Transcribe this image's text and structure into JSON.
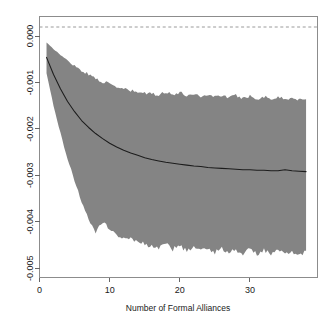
{
  "chart_data": {
    "type": "line",
    "title": "",
    "subtitle": "",
    "xlabel": "Number of Formal Alliances",
    "ylabel": "",
    "xlim": [
      0,
      39.7
    ],
    "ylim": [
      -0.0052,
      0.00042
    ],
    "grid": false,
    "legend": null,
    "colors": {
      "band_fill": "#848484",
      "fit_line": "#1c1c1c",
      "zero_line": "#9a9a9a",
      "frame": "#8c8c8c"
    },
    "annotations": [
      {
        "name": "zero-reference-line",
        "type": "hline",
        "y": 0.0,
        "style": "dashed"
      }
    ],
    "xticks": [
      0,
      10,
      20,
      30
    ],
    "xticklabels": [
      "0",
      "10",
      "20",
      "30"
    ],
    "yticks": [
      0.0,
      -0.001,
      -0.002,
      -0.003,
      -0.004,
      -0.005
    ],
    "yticklabels": [
      "0.000",
      "-0.001",
      "-0.002",
      "-0.003",
      "-0.004",
      "-0.005"
    ],
    "x": [
      1,
      2,
      3,
      4,
      5,
      6,
      7,
      8,
      9,
      10,
      11,
      12,
      13,
      14,
      15,
      16,
      17,
      18,
      19,
      20,
      21,
      22,
      23,
      24,
      25,
      26,
      27,
      28,
      29,
      30,
      31,
      32,
      33,
      34,
      35,
      36,
      37,
      38
    ],
    "series": [
      {
        "name": "estimated effect",
        "type": "line",
        "values": [
          -0.00046,
          -0.00083,
          -0.00114,
          -0.00141,
          -0.00163,
          -0.00182,
          -0.00197,
          -0.0021,
          -0.00221,
          -0.00231,
          -0.00239,
          -0.00246,
          -0.00252,
          -0.00257,
          -0.00262,
          -0.00266,
          -0.00269,
          -0.00272,
          -0.00274,
          -0.00276,
          -0.00278,
          -0.0028,
          -0.00281,
          -0.00283,
          -0.00284,
          -0.00285,
          -0.00286,
          -0.00287,
          -0.00288,
          -0.00288,
          -0.00289,
          -0.00289,
          -0.0029,
          -0.0029,
          -0.00288,
          -0.0029,
          -0.00291,
          -0.00292
        ]
      },
      {
        "name": "confidence band upper",
        "type": "band-edge",
        "values": [
          -0.00014,
          -0.00028,
          -0.00041,
          -0.00053,
          -0.00064,
          -0.00074,
          -0.00083,
          -0.00091,
          -0.00098,
          -0.00104,
          -0.0011,
          -0.00114,
          -0.00118,
          -0.00121,
          -0.00123,
          -0.00125,
          -0.00126,
          -0.0012,
          -0.00126,
          -0.00122,
          -0.00128,
          -0.00124,
          -0.0013,
          -0.00126,
          -0.00131,
          -0.00127,
          -0.00133,
          -0.00128,
          -0.00134,
          -0.00129,
          -0.00135,
          -0.0013,
          -0.00136,
          -0.00131,
          -0.00137,
          -0.00132,
          -0.00138,
          -0.00133
        ]
      },
      {
        "name": "confidence band lower",
        "type": "band-edge",
        "values": [
          -0.0008,
          -0.0015,
          -0.0021,
          -0.00264,
          -0.00312,
          -0.00355,
          -0.00392,
          -0.0042,
          -0.00398,
          -0.00416,
          -0.00428,
          -0.00438,
          -0.00434,
          -0.00442,
          -0.00448,
          -0.00452,
          -0.00456,
          -0.00447,
          -0.00459,
          -0.00452,
          -0.00462,
          -0.00454,
          -0.00464,
          -0.00456,
          -0.00466,
          -0.00457,
          -0.00467,
          -0.00459,
          -0.00468,
          -0.0046,
          -0.00469,
          -0.00461,
          -0.0047,
          -0.00462,
          -0.00471,
          -0.00463,
          -0.00472,
          -0.00464
        ]
      }
    ]
  },
  "axes": {
    "x_title": "Number of Formal Alliances"
  }
}
